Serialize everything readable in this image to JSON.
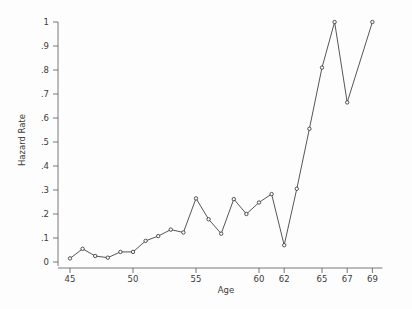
{
  "chart_data": {
    "type": "line",
    "title": "",
    "xlabel": "Age",
    "ylabel": "Hazard Rate",
    "xlim": [
      44.4,
      69.8
    ],
    "ylim": [
      0,
      1.02
    ],
    "grid": false,
    "legend": null,
    "marker": "open-circle",
    "x": [
      45,
      46,
      47,
      48,
      49,
      50,
      51,
      52,
      53,
      54,
      55,
      56,
      57,
      58,
      59,
      60,
      61,
      62,
      63,
      64,
      65,
      66,
      67,
      69
    ],
    "values": [
      0.015,
      0.055,
      0.025,
      0.018,
      0.042,
      0.042,
      0.088,
      0.108,
      0.135,
      0.123,
      0.265,
      0.178,
      0.118,
      0.262,
      0.2,
      0.248,
      0.283,
      0.07,
      0.305,
      0.555,
      0.81,
      1.0,
      0.665,
      1.0
    ],
    "xticks": [
      45,
      50,
      55,
      60,
      62,
      65,
      67,
      69
    ],
    "xtick_labels": [
      "45",
      "50",
      "55",
      "60",
      "62",
      "65",
      "67",
      "69"
    ],
    "yticks": [
      0,
      0.1,
      0.2,
      0.3,
      0.4,
      0.5,
      0.6,
      0.7,
      0.8,
      0.9,
      1.0
    ],
    "ytick_labels": [
      "0",
      ".1",
      ".2",
      ".3",
      ".4",
      ".5",
      ".6",
      ".7",
      ".8",
      ".9",
      "1"
    ],
    "colors": {
      "background": "#fdfdfd",
      "line": "#2b2b2b",
      "marker_fill": "#fdfdfd",
      "marker_stroke": "#2b2b2b",
      "axis": "#555555",
      "text": "#3a3a3a"
    }
  }
}
